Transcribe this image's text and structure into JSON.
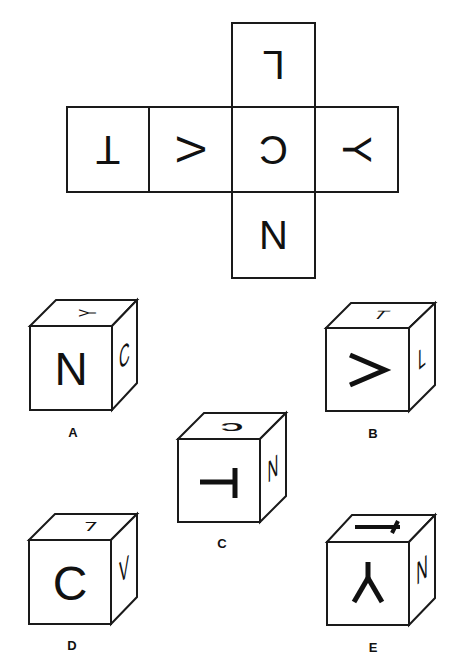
{
  "net": {
    "cells": [
      {
        "id": "top",
        "letter": "L",
        "x": 232,
        "y": 23,
        "w": 83,
        "h": 84,
        "rotate": 180
      },
      {
        "id": "left2",
        "letter": "T",
        "x": 67,
        "y": 107,
        "w": 82,
        "h": 85,
        "rotate": 180
      },
      {
        "id": "left1",
        "letter": "V",
        "x": 149,
        "y": 107,
        "w": 83,
        "h": 85,
        "rotate": 90
      },
      {
        "id": "center",
        "letter": "C",
        "x": 232,
        "y": 107,
        "w": 83,
        "h": 85,
        "rotate": 180
      },
      {
        "id": "right",
        "letter": "Y",
        "x": 315,
        "y": 107,
        "w": 83,
        "h": 85,
        "rotate": 90
      },
      {
        "id": "bottom",
        "letter": "N",
        "x": 232,
        "y": 192,
        "w": 83,
        "h": 86,
        "rotate": 0
      }
    ]
  },
  "options": [
    {
      "label": "A",
      "front": "N",
      "top": "Y",
      "side": "C"
    },
    {
      "label": "B",
      "front": "V",
      "top": "T",
      "side": "L"
    },
    {
      "label": "C",
      "front": "T",
      "top": "C",
      "side": "N"
    },
    {
      "label": "D",
      "front": "C",
      "top": "L",
      "side": "V"
    },
    {
      "label": "E",
      "front": "Y",
      "top": "T",
      "side": "N"
    }
  ],
  "colors": {
    "ink": "#111111",
    "background": "#ffffff"
  }
}
